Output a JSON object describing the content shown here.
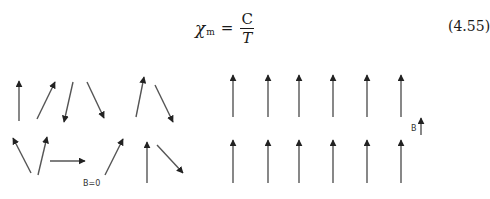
{
  "equation": {
    "symbol": "χ",
    "subscript": "m",
    "equals": "=",
    "numerator": "C",
    "denominator": "T",
    "number": "(4.55)"
  },
  "figure": {
    "left_panel": {
      "label": "B=0",
      "description": "randomly oriented magnetic moments",
      "arrows": [
        {
          "x1": 19,
          "y1": 121,
          "x2": 19,
          "y2": 81
        },
        {
          "x1": 37,
          "y1": 119,
          "x2": 55,
          "y2": 82
        },
        {
          "x1": 73,
          "y1": 82,
          "x2": 64,
          "y2": 122
        },
        {
          "x1": 87,
          "y1": 82,
          "x2": 104,
          "y2": 118
        },
        {
          "x1": 136,
          "y1": 117,
          "x2": 144,
          "y2": 77
        },
        {
          "x1": 155,
          "y1": 85,
          "x2": 173,
          "y2": 122
        },
        {
          "x1": 31,
          "y1": 173,
          "x2": 13,
          "y2": 138
        },
        {
          "x1": 38,
          "y1": 175,
          "x2": 47,
          "y2": 137
        },
        {
          "x1": 50,
          "y1": 161,
          "x2": 85,
          "y2": 161
        },
        {
          "x1": 105,
          "y1": 175,
          "x2": 123,
          "y2": 139
        },
        {
          "x1": 147,
          "y1": 183,
          "x2": 147,
          "y2": 142
        },
        {
          "x1": 157,
          "y1": 145,
          "x2": 183,
          "y2": 173
        }
      ]
    },
    "right_panel": {
      "label": "B",
      "description": "aligned magnetic moments in field B",
      "columns_x": [
        233,
        268,
        299,
        333,
        367,
        401
      ],
      "rows": [
        {
          "tail_y": 117,
          "head_y": 75
        },
        {
          "tail_y": 183,
          "head_y": 140
        }
      ],
      "field_arrow": {
        "x": 421,
        "y1": 135,
        "y2": 118
      }
    },
    "arrow_color": "#555555",
    "head_color": "#222222"
  }
}
